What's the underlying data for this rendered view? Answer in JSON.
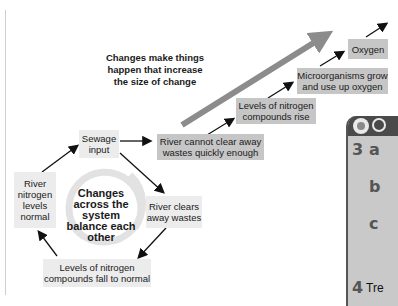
{
  "diagram": {
    "caption": "Changes make things happen that increase the size of change",
    "center_label": "Changes across the system balance each other",
    "boxes": {
      "sewage": "Sewage input",
      "cannot_clear": "River cannot clear away wastes quickly enough",
      "nitrogen_rise": "Levels of nitrogen compounds rise",
      "microorganisms": "Microorganisms grow and use up oxygen",
      "oxygen": "Oxygen",
      "clears": "River clears away wastes",
      "fall_normal": "Levels of nitrogen compounds fall to normal",
      "normal": "River nitrogen levels normal"
    }
  },
  "panel": {
    "q3": "3",
    "q3a": "a",
    "q3b": "b",
    "q3c": "c",
    "q4_num": "4",
    "q4_text": "Tre"
  }
}
